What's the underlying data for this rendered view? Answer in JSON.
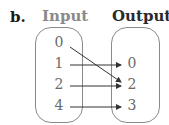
{
  "label": "b.",
  "headers": {
    "input": "Input",
    "output": "Output"
  },
  "inputs": [
    "0",
    "1",
    "2",
    "4"
  ],
  "outputs": [
    "0",
    "2",
    "3"
  ],
  "mappings": [
    {
      "from": "0",
      "to": "2"
    },
    {
      "from": "1",
      "to": "0"
    },
    {
      "from": "2",
      "to": "2"
    },
    {
      "from": "4",
      "to": "3"
    }
  ],
  "colors": {
    "box": "#8a8a8a",
    "arrow": "#333333",
    "number": "#6a6a6a"
  }
}
